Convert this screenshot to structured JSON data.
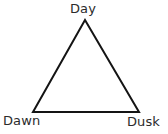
{
  "diagram": {
    "type": "triangle-cycle",
    "canvas": {
      "width": 168,
      "height": 134
    },
    "background_color": "#ffffff",
    "stroke_color": "#141414",
    "stroke_width": 2,
    "text_color": "#2b2b2b",
    "shape": {
      "name": "triangle-outline",
      "points": "85,20 139,112 33,112",
      "vertices": [
        {
          "id": "apex",
          "x": 85,
          "y": 20
        },
        {
          "id": "bottom-right",
          "x": 139,
          "y": 112
        },
        {
          "id": "bottom-left",
          "x": 33,
          "y": 112
        }
      ]
    },
    "labels": {
      "top": "Day",
      "bottom_left": "Dawn",
      "bottom_right": "Dusk"
    }
  }
}
